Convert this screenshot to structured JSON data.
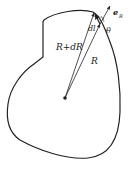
{
  "diagram": {
    "labels": {
      "radius_plus": "R+dR",
      "radius": "R",
      "dl": "dl",
      "theta": "θ",
      "unit_vector": "e",
      "unit_vector_sub": "R"
    },
    "colors": {
      "stroke": "#222222",
      "background": "#ffffff"
    }
  }
}
